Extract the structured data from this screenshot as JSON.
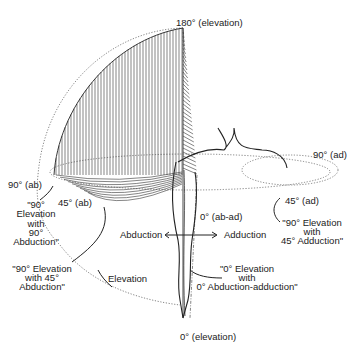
{
  "diagram": {
    "labels": {
      "elevation_180": "180° (elevation)",
      "elevation_0": "0° (elevation)",
      "ab_90": "90° (ab)",
      "ab_45": "45° (ab)",
      "ad_90": "90° (ad)",
      "ad_45": "45° (ad)",
      "ab_ad_0": "0° (ab-ad)",
      "abduction": "Abduction",
      "adduction": "Adduction",
      "elevation": "Elevation"
    },
    "callouts": {
      "elev90_abd90": [
        "\"90°",
        "Elevation",
        "with",
        "90°",
        "Abduction\""
      ],
      "elev90_abd45": [
        "\"90° Elevation",
        "with 45°",
        "Abduction\""
      ],
      "elev90_add45": [
        "\"90° Elevation",
        "with",
        "45° Adduction\""
      ],
      "elev0_abad0": [
        "\"0° Elevation",
        "with",
        "0° Abduction-adduction\""
      ]
    }
  }
}
